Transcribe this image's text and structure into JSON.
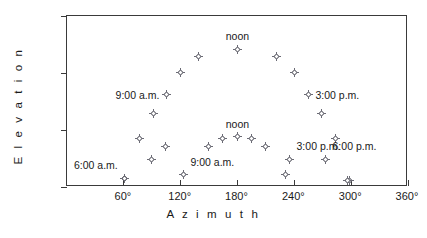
{
  "chart_data": {
    "type": "scatter",
    "title": "",
    "xlabel": "Azimuth",
    "ylabel": "Elevation",
    "xlim": [
      0,
      360
    ],
    "ylim": [
      0,
      90
    ],
    "grid": false,
    "legend": "none",
    "xticks": [
      {
        "value": 60,
        "label": "60°"
      },
      {
        "value": 120,
        "label": "120°"
      },
      {
        "value": 180,
        "label": "180°"
      },
      {
        "value": 240,
        "label": "240°"
      },
      {
        "value": 300,
        "label": "300°"
      },
      {
        "value": 360,
        "label": "360°"
      }
    ],
    "yticks": [
      {
        "value": 0,
        "label": "0°"
      },
      {
        "value": 30,
        "label": "30°"
      },
      {
        "value": 60,
        "label": "60°"
      },
      {
        "value": 90,
        "label": "zenith"
      }
    ],
    "series": [
      {
        "name": "summer sun path",
        "points": [
          {
            "x": 62,
            "y": 4
          },
          {
            "x": 78,
            "y": 25
          },
          {
            "x": 92,
            "y": 38
          },
          {
            "x": 106,
            "y": 48,
            "label": "9:00 a.m.",
            "label_pos": "left"
          },
          {
            "x": 121,
            "y": 60
          },
          {
            "x": 140,
            "y": 68
          },
          {
            "x": 181,
            "y": 72,
            "label": "noon",
            "label_pos": "above"
          },
          {
            "x": 222,
            "y": 68
          },
          {
            "x": 241,
            "y": 60
          },
          {
            "x": 256,
            "y": 48,
            "label": "3:00 p.m.",
            "label_pos": "right"
          },
          {
            "x": 270,
            "y": 38
          },
          {
            "x": 285,
            "y": 25
          },
          {
            "x": 299,
            "y": 3
          }
        ]
      },
      {
        "name": "winter sun path",
        "points": [
          {
            "x": 62,
            "y": 4,
            "label": "6:00 a.m.",
            "label_pos": "left_offset"
          },
          {
            "x": 90,
            "y": 14
          },
          {
            "x": 105,
            "y": 21
          },
          {
            "x": 124,
            "y": 6,
            "label": "9:00 a.m.",
            "label_pos": "right_offset"
          },
          {
            "x": 150,
            "y": 21
          },
          {
            "x": 165,
            "y": 25
          },
          {
            "x": 181,
            "y": 26,
            "label": "noon",
            "label_pos": "above"
          },
          {
            "x": 196,
            "y": 25
          },
          {
            "x": 211,
            "y": 21
          },
          {
            "x": 232,
            "y": 6
          },
          {
            "x": 236,
            "y": 14,
            "label": "3:00 p.m.",
            "label_pos": "right_offset"
          },
          {
            "x": 274,
            "y": 14,
            "label": "6:00 p.m.",
            "label_pos": "right_offset"
          },
          {
            "x": 297,
            "y": 3
          }
        ]
      }
    ]
  },
  "axes": {
    "x_title": "A z i m u t h",
    "y_title": "E l e v a t i o n"
  }
}
